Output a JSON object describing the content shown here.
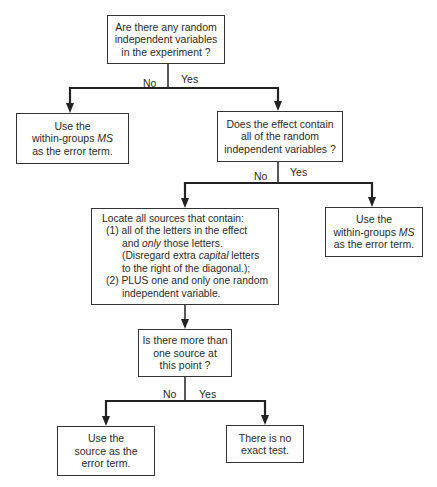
{
  "nodes": {
    "q1": {
      "lines": [
        "Are there any random",
        "independent variables",
        "in the experiment ?"
      ]
    },
    "a1": {
      "lines": [
        "Use the",
        "within-groups ",
        "as the error term."
      ],
      "italic": "MS"
    },
    "q2": {
      "lines": [
        "Does the effect contain",
        "all of the random",
        "independent variables ?"
      ]
    },
    "a2": {
      "lines": [
        "Use the",
        "within-groups ",
        "as the error term."
      ],
      "italic": "MS"
    },
    "step": {
      "line1": "Locate all sources that contain:",
      "line2": "(1) all of the letters in the effect",
      "line3a": "and ",
      "line3i": "only",
      "line3b": " those letters.",
      "line4a": "(Disregard extra ",
      "line4i": "capital",
      "line4b": " letters",
      "line5": "to the right of the diagonal.);",
      "line6": "(2) PLUS one and only one random",
      "line7": "independent variable."
    },
    "q3": {
      "lines": [
        "Is there more than",
        "one source at",
        "this point ?"
      ]
    },
    "a3": {
      "lines": [
        "Use the",
        "source as the",
        "error term."
      ]
    },
    "a4": {
      "lines": [
        "There is no",
        "exact test."
      ]
    }
  },
  "branches": {
    "b1": {
      "no": "No",
      "yes": "Yes"
    },
    "b2": {
      "no": "No",
      "yes": "Yes"
    },
    "b3": {
      "no": "No",
      "yes": "Yes"
    }
  }
}
